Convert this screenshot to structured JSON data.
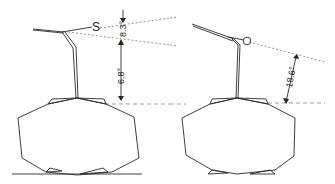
{
  "figure": {
    "left_panel": {
      "marker_label": "S",
      "upper_angle": "8.3°",
      "lower_angle": "6.8°"
    },
    "right_panel": {
      "marker_label": "O",
      "angle": "18.6°"
    }
  }
}
